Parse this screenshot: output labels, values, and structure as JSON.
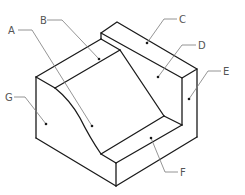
{
  "figure": {
    "type": "isometric-part-drawing",
    "labels": [
      {
        "id": "A",
        "text": "A",
        "x": 8,
        "y": 34
      },
      {
        "id": "B",
        "text": "B",
        "x": 40,
        "y": 24
      },
      {
        "id": "C",
        "text": "C",
        "x": 180,
        "y": 22
      },
      {
        "id": "D",
        "text": "D",
        "x": 199,
        "y": 48
      },
      {
        "id": "E",
        "text": "E",
        "x": 224,
        "y": 75
      },
      {
        "id": "F",
        "text": "F",
        "x": 181,
        "y": 175
      },
      {
        "id": "G",
        "text": "G",
        "x": 6,
        "y": 101
      }
    ]
  },
  "colors": {
    "edge": "#1a1a1a",
    "leader": "#7a7a7a",
    "label": "#555555",
    "background": "#ffffff"
  }
}
